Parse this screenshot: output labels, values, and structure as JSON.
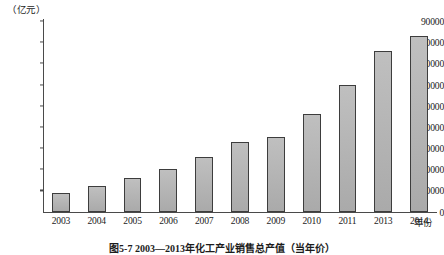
{
  "figure": {
    "caption": "图5-7  2003—2013年化工产业销售总产值（当年价）",
    "unit_label": "（亿元）",
    "x_axis_title": "年份"
  },
  "chart_data": {
    "type": "bar",
    "title": "图5-7  2003—2013年化工产业销售总产值（当年价）",
    "xlabel": "年份",
    "ylabel": "（亿元）",
    "ylim": [
      0,
      90000
    ],
    "grid": false,
    "legend": "none",
    "y_ticks": [
      0,
      10000,
      20000,
      30000,
      40000,
      50000,
      60000,
      70000,
      80000,
      90000
    ],
    "y_tick_labels": [
      "0",
      "10000",
      "20000",
      "30000",
      "40000",
      "50000",
      "60000",
      "70000",
      "80000",
      "90000"
    ],
    "categories": [
      "2003",
      "2004",
      "2005",
      "2006",
      "2007",
      "2008",
      "2009",
      "2010",
      "2011",
      "2013",
      "2014"
    ],
    "values": [
      9000,
      12000,
      16000,
      20000,
      26000,
      33000,
      35000,
      46000,
      60000,
      76000,
      83000
    ],
    "bar_color": "#b3b3b3",
    "bar_edge_color": "#3d3d3d",
    "axis_color": "#4a4a4a"
  }
}
